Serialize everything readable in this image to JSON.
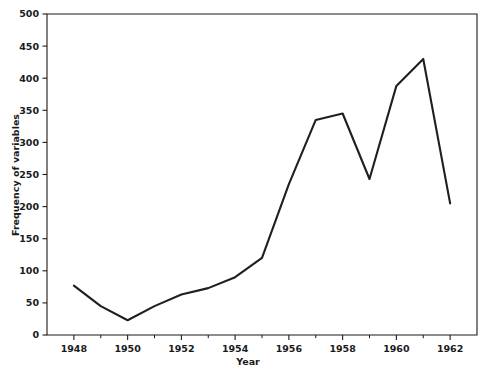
{
  "chart_data": {
    "type": "line",
    "title": "",
    "xlabel": "Year",
    "ylabel": "Frequency of variables",
    "x": [
      1948,
      1949,
      1950,
      1951,
      1952,
      1953,
      1954,
      1955,
      1956,
      1957,
      1958,
      1959,
      1960,
      1961,
      1962
    ],
    "values": [
      77,
      45,
      23,
      45,
      63,
      73,
      90,
      120,
      235,
      335,
      345,
      243,
      388,
      430,
      205
    ],
    "series": [
      {
        "name": "Frequency of variables",
        "values": [
          77,
          45,
          23,
          45,
          63,
          73,
          90,
          120,
          235,
          335,
          345,
          243,
          388,
          430,
          205
        ]
      }
    ],
    "xlim": [
      1947,
      1963
    ],
    "ylim": [
      0,
      500
    ],
    "xticks": [
      1948,
      1950,
      1952,
      1954,
      1956,
      1958,
      1960,
      1962
    ],
    "xtick_labels": [
      "1948",
      "1950",
      "1952",
      "1954",
      "1956",
      "1958",
      "1960",
      "1962"
    ],
    "xticks_minor": [
      1949,
      1951,
      1953,
      1955,
      1957,
      1959,
      1961
    ],
    "yticks": [
      0,
      50,
      100,
      150,
      200,
      250,
      300,
      350,
      400,
      450,
      500
    ],
    "ytick_labels": [
      "0",
      "50",
      "100",
      "150",
      "200",
      "250",
      "300",
      "350",
      "400",
      "450",
      "500"
    ],
    "grid": false,
    "legend": false,
    "legend_position": "none",
    "line_color": "#1f1f1f",
    "axis_color": "#1a1a1a",
    "background_color": "#ffffff",
    "frame": [
      "left",
      "top",
      "right",
      "bottom"
    ]
  },
  "axes": {
    "y_title": "Frequency of variables",
    "x_title": "Year"
  }
}
